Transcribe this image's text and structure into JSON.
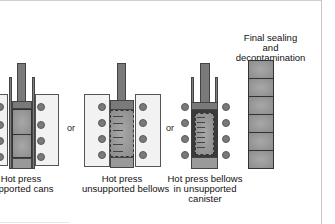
{
  "diagram": {
    "panels": [
      {
        "id": "hot-press-supported-cans",
        "label": "Hot press\nsupported cans"
      },
      {
        "id": "hot-press-unsupported-bellows",
        "label": "Hot press\nunsupported bellows"
      },
      {
        "id": "hot-press-bellows-in-unsupported-canister",
        "label": "Hot press bellows\nin unsupported\ncanister"
      },
      {
        "id": "final-sealing",
        "label": "Final sealing\nand\ndecontamination"
      }
    ],
    "connectors": [
      "or",
      "or"
    ],
    "final_stack_cells": 6
  }
}
